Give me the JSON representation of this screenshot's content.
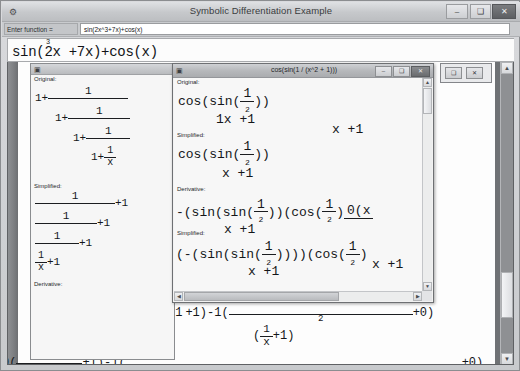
{
  "window": {
    "title": "Symbolic Differentiation Example",
    "icon": "app-icon",
    "minimize": "–",
    "maximize": "❑",
    "close": "✕"
  },
  "toolbar": {
    "function_label": "Enter function =",
    "function_value": "sin(2x^3+7x)+cos(x)",
    "function_placeholder": "enter a function"
  },
  "formula_strip": {
    "exponent": "3",
    "expression": "sin(2x +7x)+cos(x)"
  },
  "left_child": {
    "icon": "doc-icon",
    "title": "",
    "sections": {
      "original_label": "Original:",
      "simplified_label": "Simplified:",
      "derivative_label": "Derivative:"
    },
    "original": {
      "lead": "1+",
      "n1": "1",
      "d1_lead": "1+",
      "n2": "1",
      "d2_lead": "1+",
      "n3": "1",
      "d3_lead": "1+",
      "n4": "1",
      "d4": "x"
    },
    "simplified": {
      "n1": "1",
      "tail": "+1",
      "n2": "1",
      "n3": "1",
      "n4": "1",
      "d4": "x"
    }
  },
  "mid_child": {
    "icon": "doc-icon",
    "title": "cos(sin(1 / (x^2 + 1)))",
    "minimize": "–",
    "maximize": "❑",
    "close": "✕",
    "original_label": "Original:",
    "simplified_label": "Simplified:",
    "derivative_label": "Derivative:",
    "second_simplified_label": "Simplified:",
    "original": {
      "pre": "cos(sin(",
      "num": "1",
      "den": "1x +1",
      "den_exp": "2",
      "post": "))"
    },
    "simplified": {
      "pre": "cos(sin(",
      "num": "1",
      "den": "x +1",
      "den_exp": "2",
      "post": "))"
    },
    "derivative": {
      "pre": "-(sin(sin(",
      "num1": "1",
      "den1": "x +1",
      "den1_exp": "2",
      "mid": "))(cos(",
      "num2": "1",
      "den2": "x +1",
      "den2_exp": "2",
      "post": ")",
      "tail_num": "0(x",
      "tail_den": ""
    },
    "second_simplified": {
      "pre": "(-(sin(sin(",
      "num1": "1",
      "den1": "x +1",
      "den1_exp": "2",
      "mid": "))))(cos(",
      "num2": "1",
      "den2": "x +1",
      "den2_exp": "2",
      "post": ")"
    },
    "scroll": {
      "up": "▲",
      "down": "▼",
      "left": "◀",
      "right": "▶"
    }
  },
  "right_child": {
    "restore": "❑",
    "close": "✕"
  },
  "main_scroll": {
    "up": "▲",
    "down": "▼"
  },
  "bottom_formulas": {
    "row1": {
      "lead": "0(",
      "num": "",
      "den_a": "1",
      "den_b": "x",
      "den_tail": "+1",
      "mid": "+1)-1(",
      "exp": "2",
      "tail": "+0)"
    },
    "row2": {
      "lead": "0(",
      "num": "1",
      "mid": "+1)-1(",
      "inner_a": "(",
      "inner_b": "1",
      "inner_c": "x",
      "inner_d": "+1)",
      "tail": "+0)"
    },
    "row3": {
      "lead": "1)-1(",
      "tail": "+0)"
    }
  },
  "colors": {
    "desktop": "#6f7275",
    "window_chrome": "#c8cacd",
    "sheet": "#fdfdfd",
    "text": "#141619"
  }
}
